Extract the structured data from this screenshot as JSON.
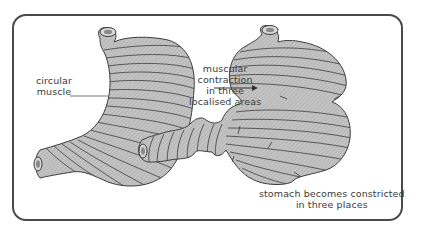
{
  "diagram": {
    "type": "labelled illustration",
    "figures": [
      {
        "id": "relaxed-stomach",
        "description": "stomach with circular muscle bands"
      },
      {
        "id": "contracted-stomach",
        "description": "stomach constricted in three places"
      }
    ],
    "labels": {
      "circular_muscle": [
        "circular",
        "muscle"
      ],
      "contraction": [
        "muscular",
        "contraction",
        "in three",
        "localised areas"
      ],
      "constricted": [
        "stomach becomes constricted",
        "in three places"
      ]
    },
    "colors": {
      "frame": "#4a4a4a",
      "stomach_fill": "#bdbdbd",
      "muscle_lines": "#3c3c3c",
      "text": "#3a3a3a"
    }
  }
}
